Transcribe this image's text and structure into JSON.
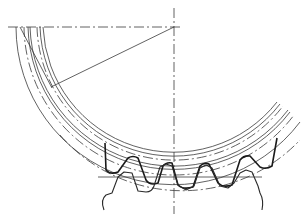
{
  "drawing": {
    "type": "gear-mesh-technical-drawing",
    "center": {
      "x": 174,
      "y": 27
    },
    "centerline_color": "#3a3a3a",
    "profile_color": "#1a1a1a",
    "arcs": [
      {
        "name": "outer-ring",
        "r": 158,
        "style": "solid"
      },
      {
        "name": "tip-circle",
        "r": 150,
        "style": "dashdot"
      },
      {
        "name": "pitch-circle",
        "r": 146,
        "style": "solid"
      },
      {
        "name": "inner-pitch",
        "r": 137,
        "style": "dashdot"
      },
      {
        "name": "root-1",
        "r": 134,
        "style": "solid"
      },
      {
        "name": "root-2",
        "r": 131,
        "style": "solid"
      }
    ],
    "radius_line": {
      "from": {
        "x": 174,
        "y": 27
      },
      "to": {
        "x": 51,
        "y": 87
      }
    }
  }
}
